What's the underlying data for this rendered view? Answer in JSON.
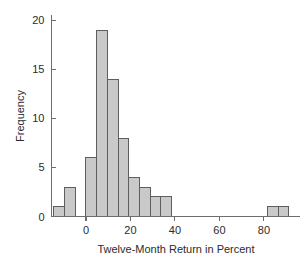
{
  "chart_data": {
    "type": "bar",
    "title": "",
    "subtitle": "",
    "xlabel": "Twelve-Month Return in Percent",
    "ylabel": "Frequency",
    "xlim": [
      -15.5,
      96
    ],
    "ylim": [
      0,
      20.6
    ],
    "bin_width": 4.8,
    "grid": false,
    "legend": null,
    "xticks": [
      0,
      20,
      40,
      60,
      80
    ],
    "xtick_labels": [
      "0",
      "20",
      "40",
      "60",
      "80"
    ],
    "yticks": [
      0,
      5,
      10,
      15,
      20
    ],
    "ytick_labels": [
      "0",
      "5",
      "10",
      "15",
      "20"
    ],
    "bin_edges": [
      -14.4,
      -9.6,
      -4.8,
      0.0,
      4.8,
      9.6,
      14.4,
      19.2,
      24.0,
      28.8,
      33.6,
      38.4,
      43.2,
      48.0,
      52.8,
      57.6,
      62.4,
      67.2,
      72.0,
      76.8,
      81.6,
      86.4,
      91.2
    ],
    "categories": [
      "-14.4 to -9.6",
      "-9.6 to -4.8",
      "-4.8 to 0.0",
      "0.0 to 4.8",
      "4.8 to 9.6",
      "9.6 to 14.4",
      "14.4 to 19.2",
      "19.2 to 24.0",
      "24.0 to 28.8",
      "28.8 to 33.6",
      "33.6 to 38.4",
      "38.4 to 43.2",
      "43.2 to 48.0",
      "48.0 to 52.8",
      "52.8 to 57.6",
      "57.6 to 62.4",
      "62.4 to 67.2",
      "67.2 to 72.0",
      "72.0 to 76.8",
      "76.8 to 81.6",
      "81.6 to 86.4",
      "86.4 to 91.2"
    ],
    "values": [
      1,
      3,
      0,
      6,
      19,
      14,
      8,
      4,
      3,
      2,
      2,
      0,
      0,
      0,
      0,
      0,
      0,
      0,
      0,
      0,
      1,
      1
    ],
    "total_count": 66,
    "bar_fill_color": "#c9c9c9",
    "bar_edge_color": "#5e5e5e",
    "axis_color": "#6d6d6d",
    "text_color": "#2b2b2b",
    "background_color": "#ffffff"
  }
}
